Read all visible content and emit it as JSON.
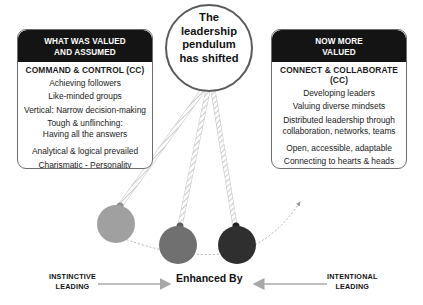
{
  "title": "The leadership pendulum has shifted",
  "left_box": {
    "header_line1": "WHAT WAS VALUED",
    "header_line2": "AND ASSUMED",
    "subtitle": "COMMAND & CONTROL (CC)",
    "items": [
      "Achieving followers",
      "Like-minded groups",
      "Vertical: Narrow decision-making",
      "Tough & unflinching:",
      "Having all the answers",
      "Analytical & logical prevailed",
      "Charismatic - Personality"
    ]
  },
  "right_box": {
    "header_line1": "NOW MORE",
    "header_line2": "VALUED",
    "subtitle": "CONNECT & COLLABORATE (CC)",
    "items": [
      "Developing leaders",
      "Valuing diverse mindsets",
      "Distributed leadership through",
      "collaboration, networks, teams",
      "Open, accessible, adaptable",
      "Connecting to hearts & heads",
      "Humility & character"
    ]
  },
  "circle": {
    "line1": "The",
    "line2": "leadership",
    "line3": "pendulum",
    "line4": "has shifted"
  },
  "bottom": {
    "left_line1": "INSTINCTIVE",
    "left_line2": "LEADING",
    "center": "Enhanced By",
    "right_line1": "INTENTIONAL",
    "right_line2": "LEADING"
  },
  "colors": {
    "header_bg": "#141414",
    "ball_light": "#9e9e9e",
    "ball_mid": "#6f6f6f",
    "ball_dark": "#2e2e2e",
    "arrow": "#a8a8a8"
  }
}
